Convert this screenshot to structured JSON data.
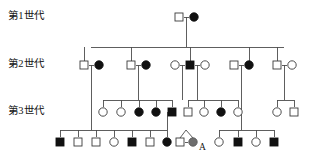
{
  "figure": {
    "kind": "pedigree-chart",
    "width": 313,
    "height": 158,
    "background_color": "#ffffff",
    "line_color": "#4d4d4d",
    "affected_color": "#111111",
    "unaffected_color": "#ffffff",
    "proband_gray_color": "#6e6e6e",
    "outline_color": "#3a3a3a"
  },
  "generation_labels": [
    {
      "id": "gen1-label",
      "text": "第1世代",
      "x": 8,
      "y": 17
    },
    {
      "id": "gen2-label",
      "text": "第2世代",
      "x": 8,
      "y": 65
    },
    {
      "id": "gen3-label",
      "text": "第3世代",
      "x": 8,
      "y": 112
    }
  ],
  "annotations": [
    {
      "id": "proband-label-a",
      "text": "A",
      "x": 199,
      "y": 148
    }
  ],
  "legend_semantics": {
    "square": "male",
    "circle": "female",
    "filled": "affected",
    "open": "unaffected",
    "gray": "marked individual A"
  },
  "rows": {
    "gen1_y": 17,
    "gen2_y": 65,
    "gen3_y": 112,
    "gen4_y": 142
  },
  "individuals": [
    {
      "id": "I-1",
      "shape": "square",
      "state": "open",
      "sex": "male",
      "affected": false,
      "generation": 1,
      "cx": 179,
      "cy": 17
    },
    {
      "id": "I-2",
      "shape": "circle",
      "state": "filled",
      "sex": "female",
      "affected": true,
      "generation": 1,
      "cx": 194,
      "cy": 17
    },
    {
      "id": "II-1",
      "shape": "square",
      "state": "open",
      "sex": "male",
      "affected": false,
      "generation": 2,
      "cx": 84,
      "cy": 65
    },
    {
      "id": "II-2",
      "shape": "circle",
      "state": "filled",
      "sex": "female",
      "affected": true,
      "generation": 2,
      "cx": 99,
      "cy": 65
    },
    {
      "id": "II-3",
      "shape": "square",
      "state": "open",
      "sex": "male",
      "affected": false,
      "generation": 2,
      "cx": 131,
      "cy": 65
    },
    {
      "id": "II-4",
      "shape": "circle",
      "state": "filled",
      "sex": "female",
      "affected": true,
      "generation": 2,
      "cx": 146,
      "cy": 65
    },
    {
      "id": "II-5",
      "shape": "circle",
      "state": "open",
      "sex": "female",
      "affected": false,
      "generation": 2,
      "cx": 175,
      "cy": 65
    },
    {
      "id": "II-6",
      "shape": "square",
      "state": "filled",
      "sex": "male",
      "affected": true,
      "generation": 2,
      "cx": 190,
      "cy": 65
    },
    {
      "id": "II-7",
      "shape": "circle",
      "state": "open",
      "sex": "female",
      "affected": false,
      "generation": 2,
      "cx": 205,
      "cy": 65
    },
    {
      "id": "II-8",
      "shape": "square",
      "state": "open",
      "sex": "male",
      "affected": false,
      "generation": 2,
      "cx": 234,
      "cy": 65
    },
    {
      "id": "II-9",
      "shape": "circle",
      "state": "filled",
      "sex": "female",
      "affected": true,
      "generation": 2,
      "cx": 249,
      "cy": 65
    },
    {
      "id": "II-10",
      "shape": "square",
      "state": "open",
      "sex": "male",
      "affected": false,
      "generation": 2,
      "cx": 277,
      "cy": 65
    },
    {
      "id": "II-11",
      "shape": "circle",
      "state": "open",
      "sex": "female",
      "affected": false,
      "generation": 2,
      "cx": 292,
      "cy": 65
    },
    {
      "id": "III-1",
      "shape": "circle",
      "state": "open",
      "sex": "female",
      "affected": false,
      "generation": 3,
      "cx": 103,
      "cy": 112
    },
    {
      "id": "III-2",
      "shape": "circle",
      "state": "open",
      "sex": "female",
      "affected": false,
      "generation": 3,
      "cx": 121,
      "cy": 112
    },
    {
      "id": "III-3",
      "shape": "circle",
      "state": "filled",
      "sex": "female",
      "affected": true,
      "generation": 3,
      "cx": 139,
      "cy": 112
    },
    {
      "id": "III-4",
      "shape": "circle",
      "state": "filled",
      "sex": "female",
      "affected": true,
      "generation": 3,
      "cx": 156,
      "cy": 112
    },
    {
      "id": "III-5",
      "shape": "square",
      "state": "filled",
      "sex": "male",
      "affected": true,
      "generation": 3,
      "cx": 172,
      "cy": 112
    },
    {
      "id": "III-6",
      "shape": "square",
      "state": "open",
      "sex": "male",
      "affected": false,
      "generation": 3,
      "cx": 188,
      "cy": 112
    },
    {
      "id": "III-7",
      "shape": "circle",
      "state": "open",
      "sex": "female",
      "affected": false,
      "generation": 3,
      "cx": 204,
      "cy": 112
    },
    {
      "id": "III-8",
      "shape": "circle",
      "state": "filled",
      "sex": "female",
      "affected": true,
      "generation": 3,
      "cx": 221,
      "cy": 112
    },
    {
      "id": "III-9",
      "shape": "circle",
      "state": "open",
      "sex": "female",
      "affected": false,
      "generation": 3,
      "cx": 238,
      "cy": 112
    },
    {
      "id": "III-10",
      "shape": "circle",
      "state": "open",
      "sex": "female",
      "affected": false,
      "generation": 3,
      "cx": 277,
      "cy": 112
    },
    {
      "id": "III-11",
      "shape": "square",
      "state": "open",
      "sex": "male",
      "affected": false,
      "generation": 3,
      "cx": 294,
      "cy": 112
    },
    {
      "id": "IV-1",
      "shape": "square",
      "state": "filled",
      "sex": "male",
      "affected": true,
      "generation": 4,
      "cx": 60,
      "cy": 142
    },
    {
      "id": "IV-2",
      "shape": "square",
      "state": "open",
      "sex": "male",
      "affected": false,
      "generation": 4,
      "cx": 78,
      "cy": 142
    },
    {
      "id": "IV-3",
      "shape": "square",
      "state": "open",
      "sex": "male",
      "affected": false,
      "generation": 4,
      "cx": 96,
      "cy": 142
    },
    {
      "id": "IV-4",
      "shape": "circle",
      "state": "open",
      "sex": "female",
      "affected": false,
      "generation": 4,
      "cx": 114,
      "cy": 142
    },
    {
      "id": "IV-5",
      "shape": "square",
      "state": "filled",
      "sex": "male",
      "affected": true,
      "generation": 4,
      "cx": 132,
      "cy": 142
    },
    {
      "id": "IV-6",
      "shape": "square",
      "state": "open",
      "sex": "male",
      "affected": false,
      "generation": 4,
      "cx": 150,
      "cy": 142
    },
    {
      "id": "IV-7",
      "shape": "circle",
      "state": "filled",
      "sex": "female",
      "affected": true,
      "generation": 4,
      "cx": 167,
      "cy": 142
    },
    {
      "id": "IV-8",
      "shape": "square",
      "state": "open",
      "sex": "male",
      "affected": false,
      "generation": 4,
      "cx": 180,
      "cy": 142
    },
    {
      "id": "IV-9",
      "shape": "circle",
      "state": "gray",
      "sex": "female",
      "affected": false,
      "generation": 4,
      "cx": 193,
      "cy": 142,
      "label": "A"
    },
    {
      "id": "IV-10",
      "shape": "circle",
      "state": "open",
      "sex": "female",
      "affected": false,
      "generation": 4,
      "cx": 219,
      "cy": 142
    },
    {
      "id": "IV-11",
      "shape": "square",
      "state": "filled",
      "sex": "male",
      "affected": true,
      "generation": 4,
      "cx": 238,
      "cy": 142
    },
    {
      "id": "IV-12",
      "shape": "circle",
      "state": "open",
      "sex": "female",
      "affected": false,
      "generation": 4,
      "cx": 256,
      "cy": 142
    },
    {
      "id": "IV-13",
      "shape": "square",
      "state": "filled",
      "sex": "male",
      "affected": true,
      "generation": 4,
      "cx": 274,
      "cy": 142
    }
  ],
  "connectors": {
    "mating_lines": [
      {
        "id": "mate-I",
        "x1": 184,
        "x2": 189,
        "y": 17
      },
      {
        "id": "mate-II-a",
        "x1": 89,
        "x2": 94,
        "y": 65
      },
      {
        "id": "mate-II-b",
        "x1": 136,
        "x2": 141,
        "y": 65
      },
      {
        "id": "mate-II-c",
        "x1": 180,
        "x2": 185,
        "y": 65
      },
      {
        "id": "mate-II-d",
        "x1": 195,
        "x2": 200,
        "y": 65
      },
      {
        "id": "mate-II-e",
        "x1": 239,
        "x2": 244,
        "y": 65
      },
      {
        "id": "mate-II-f",
        "x1": 282,
        "x2": 287,
        "y": 65
      },
      {
        "id": "mate-IV-twin-pair",
        "x1": 185,
        "x2": 188,
        "y": 142
      }
    ],
    "descent_lines": [
      {
        "id": "desc-I-drop",
        "x": 186,
        "y1": 17,
        "y2": 47
      },
      {
        "id": "desc-II-sib-drop-1",
        "x": 91,
        "y1": 65,
        "y2": 130
      },
      {
        "id": "desc-II-sib-drop-2",
        "x": 138,
        "y1": 65,
        "y2": 100
      },
      {
        "id": "desc-II-sib-drop-3",
        "x": 182,
        "y1": 65,
        "y2": 100
      },
      {
        "id": "desc-II-sib-drop-4",
        "x": 197,
        "y1": 65,
        "y2": 100
      },
      {
        "id": "desc-II-sib-drop-5",
        "x": 241,
        "y1": 65,
        "y2": 130
      },
      {
        "id": "desc-II-sib-drop-6",
        "x": 284,
        "y1": 65,
        "y2": 100
      },
      {
        "id": "desc-III-sib-drop-1",
        "x": 167,
        "y1": 112,
        "y2": 130
      }
    ],
    "sibship_bars": [
      {
        "id": "sibbar-gen2",
        "x1": 91,
        "x2": 284,
        "y": 47
      },
      {
        "id": "sibbar-gen3-a",
        "x1": 103,
        "x2": 172,
        "y": 100
      },
      {
        "id": "sibbar-gen3-b",
        "x1": 188,
        "x2": 238,
        "y": 100
      },
      {
        "id": "sibbar-gen3-c",
        "x1": 277,
        "x2": 294,
        "y": 100
      },
      {
        "id": "sibbar-gen4-a",
        "x1": 60,
        "x2": 167,
        "y": 130
      },
      {
        "id": "sibbar-gen4-b",
        "x1": 219,
        "x2": 274,
        "y": 130
      }
    ],
    "stubs": [
      {
        "id": "stub-gen2-1",
        "x": 84,
        "y1": 65,
        "y2": 47
      },
      {
        "id": "stub-gen2-2",
        "x": 131,
        "y1": 65,
        "y2": 47
      },
      {
        "id": "stub-gen2-3",
        "x": 190,
        "y1": 65,
        "y2": 47
      },
      {
        "id": "stub-gen2-4",
        "x": 249,
        "y1": 65,
        "y2": 47
      },
      {
        "id": "stub-gen2-5",
        "x": 277,
        "y1": 65,
        "y2": 47
      },
      {
        "id": "stub-gen3-1",
        "x": 103,
        "y1": 100,
        "y2": 107
      },
      {
        "id": "stub-gen3-2",
        "x": 121,
        "y1": 100,
        "y2": 107
      },
      {
        "id": "stub-gen3-3",
        "x": 139,
        "y1": 100,
        "y2": 107
      },
      {
        "id": "stub-gen3-4",
        "x": 156,
        "y1": 100,
        "y2": 107
      },
      {
        "id": "stub-gen3-5",
        "x": 172,
        "y1": 100,
        "y2": 107
      },
      {
        "id": "stub-gen3-6",
        "x": 188,
        "y1": 100,
        "y2": 107
      },
      {
        "id": "stub-gen3-7",
        "x": 204,
        "y1": 100,
        "y2": 107
      },
      {
        "id": "stub-gen3-8",
        "x": 221,
        "y1": 100,
        "y2": 107
      },
      {
        "id": "stub-gen3-9",
        "x": 238,
        "y1": 100,
        "y2": 107
      },
      {
        "id": "stub-gen3-10",
        "x": 277,
        "y1": 100,
        "y2": 107
      },
      {
        "id": "stub-gen3-11",
        "x": 294,
        "y1": 100,
        "y2": 107
      },
      {
        "id": "stub-gen4-1",
        "x": 60,
        "y1": 130,
        "y2": 137
      },
      {
        "id": "stub-gen4-2",
        "x": 78,
        "y1": 130,
        "y2": 137
      },
      {
        "id": "stub-gen4-3",
        "x": 96,
        "y1": 130,
        "y2": 137
      },
      {
        "id": "stub-gen4-4",
        "x": 114,
        "y1": 130,
        "y2": 137
      },
      {
        "id": "stub-gen4-5",
        "x": 132,
        "y1": 130,
        "y2": 137
      },
      {
        "id": "stub-gen4-6",
        "x": 150,
        "y1": 130,
        "y2": 137
      },
      {
        "id": "stub-gen4-7",
        "x": 167,
        "y1": 130,
        "y2": 137
      },
      {
        "id": "stub-gen4-8",
        "x": 219,
        "y1": 130,
        "y2": 137
      },
      {
        "id": "stub-gen4-9",
        "x": 238,
        "y1": 130,
        "y2": 137
      },
      {
        "id": "stub-gen4-10",
        "x": 256,
        "y1": 130,
        "y2": 137
      },
      {
        "id": "stub-gen4-11",
        "x": 274,
        "y1": 130,
        "y2": 137
      }
    ],
    "twin_forks": [
      {
        "id": "twin-fork-a",
        "apex_x": 186,
        "apex_y": 130,
        "left_x": 180,
        "right_x": 193,
        "base_y": 138
      }
    ]
  },
  "symbol_size": {
    "square_side": 8,
    "circle_radius": 4.2
  }
}
